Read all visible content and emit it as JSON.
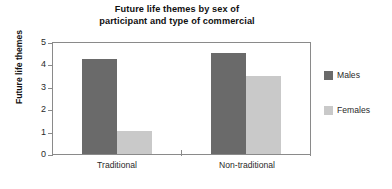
{
  "chart_data": {
    "type": "bar",
    "title": "Future life themes by sex of participant and type of commercial",
    "title_lines": [
      "Future life themes by sex of",
      "participant and type of commercial"
    ],
    "xlabel": "",
    "ylabel": "Future life themes",
    "categories": [
      "Traditional",
      "Non-traditional"
    ],
    "series": [
      {
        "name": "Males",
        "values": [
          4.3,
          4.55
        ],
        "color": "#6a6a6a"
      },
      {
        "name": "Females",
        "values": [
          1.05,
          3.5
        ],
        "color": "#c9c9c9"
      }
    ],
    "ylim": [
      0,
      5
    ],
    "yticks": [
      0,
      1,
      2,
      3,
      4,
      5
    ],
    "ytick_labels": [
      "0",
      "1",
      "2",
      "3",
      "4",
      "5"
    ],
    "grid": false,
    "legend_position": "right",
    "frame": true
  },
  "legend": {
    "entries": [
      {
        "label": "Males",
        "swatch": "males-swatch"
      },
      {
        "label": "Females",
        "swatch": "females-swatch"
      }
    ]
  },
  "axes": {
    "y_title": "Future life themes",
    "y_tick_0": "0",
    "y_tick_1": "1",
    "y_tick_2": "2",
    "y_tick_3": "3",
    "y_tick_4": "4",
    "y_tick_5": "5",
    "x_cat_0": "Traditional",
    "x_cat_1": "Non-traditional"
  },
  "title": {
    "line1": "Future life themes by sex of",
    "line2": "participant and type of commercial"
  },
  "colors": {
    "males": "#6a6a6a",
    "females": "#c9c9c9",
    "axis": "#8a8a8a",
    "text": "#1a1a1a",
    "background": "#ffffff"
  }
}
